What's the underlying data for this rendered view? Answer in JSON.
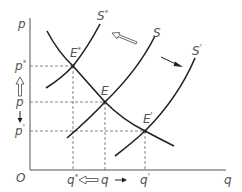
{
  "diagram": {
    "axes": {
      "y_label": "p",
      "x_label": "q",
      "origin_label": "O"
    },
    "price_levels": [
      {
        "label": "p*",
        "base": "p",
        "sup": "*"
      },
      {
        "label": "p",
        "base": "p",
        "sup": ""
      },
      {
        "label": "p'",
        "base": "p",
        "sup": "'"
      }
    ],
    "quantity_levels": [
      {
        "label": "q*",
        "base": "q",
        "sup": "*"
      },
      {
        "label": "q",
        "base": "q",
        "sup": ""
      },
      {
        "label": "q'",
        "base": "q",
        "sup": "'"
      }
    ],
    "curves": [
      {
        "name": "S*",
        "base": "S",
        "sup": "*"
      },
      {
        "name": "S",
        "base": "S",
        "sup": ""
      },
      {
        "name": "S'",
        "base": "S",
        "sup": "'"
      },
      {
        "name": "D",
        "base": "",
        "sup": ""
      }
    ],
    "equilibria": [
      {
        "label": "E*",
        "base": "E",
        "sup": "*"
      },
      {
        "label": "E",
        "base": "E",
        "sup": ""
      },
      {
        "label": "E'",
        "base": "E",
        "sup": "'"
      }
    ],
    "arrows": {
      "supply_decrease": "hollow arrow S → S*",
      "supply_increase": "solid arrow S → S'",
      "price_up": "hollow arrow p → p*",
      "price_down": "solid arrow p → p'",
      "quantity_down": "hollow arrow q → q*",
      "quantity_up": "solid arrow q → q'"
    }
  }
}
